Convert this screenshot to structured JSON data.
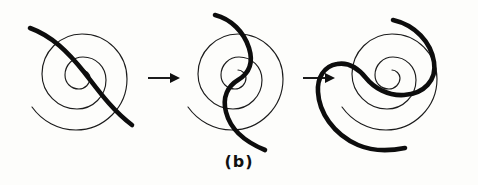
{
  "figure": {
    "caption": "(b)",
    "background_color": "#fdfdfb",
    "line_color": "#1c1c1c",
    "thick_line_color": "#0d0d0d",
    "panel_count": 3,
    "arrow_count": 2,
    "panels": [
      {
        "index": 1,
        "label": "stage-1",
        "spiral_turns": 3,
        "spiral_center": [
          82,
          78
        ],
        "thick_curve_shape": "single diagonal arc crossing spiral from upper-left to lower-right",
        "thick_curve_start": [
          30,
          28
        ],
        "thick_curve_end": [
          132,
          125
        ]
      },
      {
        "index": 2,
        "label": "stage-2",
        "spiral_turns": 3,
        "spiral_center": [
          238,
          78
        ],
        "thick_curve_shape": "S-shaped sigmoid curve threading through the spiral center",
        "thick_curve_start": [
          215,
          15
        ],
        "thick_curve_end": [
          265,
          150
        ]
      },
      {
        "index": 3,
        "label": "stage-3",
        "spiral_turns": 3,
        "spiral_center": [
          392,
          78
        ],
        "thick_curve_shape": "double hook wrapping around the spiral, S-spiral form",
        "thick_curve_start": [
          393,
          20
        ],
        "thick_curve_end": [
          405,
          148
        ]
      }
    ],
    "arrows": [
      {
        "index": 1,
        "label": "transition-arrow-1",
        "from_panel": 1,
        "to_panel": 2,
        "x": 148,
        "y": 78,
        "length": 30,
        "direction": "right"
      },
      {
        "index": 2,
        "label": "transition-arrow-2",
        "from_panel": 2,
        "to_panel": 3,
        "x": 303,
        "y": 78,
        "length": 30,
        "direction": "right"
      }
    ]
  }
}
